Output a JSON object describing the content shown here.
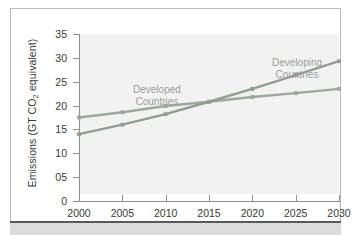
{
  "figure": {
    "background_color": "#ffffff",
    "card_border_color": "#b9b9b9",
    "rule_color": "#595959",
    "band_color": "#dcdcdc"
  },
  "axes": {
    "y_title_main": "Emissions (GT CO",
    "y_title_sub": "2",
    "y_title_tail": " equivalent)",
    "y_ticks": [
      "35",
      "30",
      "25",
      "20",
      "15",
      "10",
      "05",
      "0"
    ],
    "y_tick_values": [
      35,
      30,
      25,
      20,
      15,
      10,
      5,
      0
    ],
    "x_ticks": [
      "2000",
      "2005",
      "2010",
      "2015",
      "2020",
      "2025",
      "2030"
    ],
    "tick_color": "#8e8e8e",
    "label_color": "#3a3a3a",
    "plot_fill": "#f2f2f2"
  },
  "labels": {
    "developed": "Developed\nCountries",
    "developed_line1": "Developed",
    "developed_line2": "Countries",
    "developing_line1": "Developing",
    "developing_line2": "Countries",
    "label_color": "#9b9b9b"
  },
  "chart_data": {
    "type": "line",
    "title": "",
    "xlabel": "",
    "ylabel": "Emissions (GT CO2 equivalent)",
    "x": [
      2000,
      2005,
      2010,
      2015,
      2020,
      2025,
      2030
    ],
    "xlim": [
      2000,
      2030
    ],
    "ylim": [
      0,
      35
    ],
    "grid": false,
    "legend": "in-plot annotations",
    "series": [
      {
        "name": "Developed Countries",
        "color": "#9aa99b",
        "marker": "square",
        "values": [
          17.5,
          18.6,
          19.9,
          20.8,
          21.8,
          22.6,
          23.5
        ]
      },
      {
        "name": "Developing Countries",
        "color": "#8f9e90",
        "marker": "square",
        "values": [
          14.0,
          16.0,
          18.2,
          20.8,
          23.5,
          26.4,
          29.3
        ]
      }
    ],
    "annotations": [
      {
        "text": "Developed Countries",
        "x": 2002.5,
        "y": 24.5
      },
      {
        "text": "Developing Countries",
        "x": 2022,
        "y": 30.5
      }
    ]
  }
}
